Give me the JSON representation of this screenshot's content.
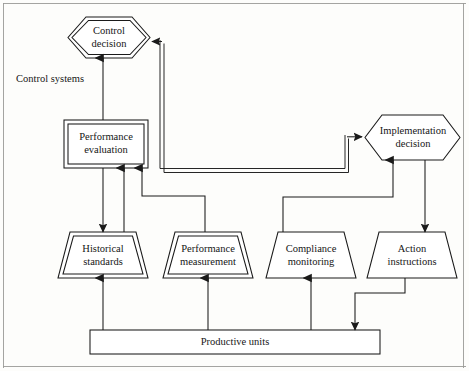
{
  "figure": {
    "background_color": "#fdfdfb",
    "line_color": "#1a1a1a",
    "text_color": "#161616"
  },
  "side_labels": [
    {
      "name": "control-systems",
      "line1": "Control",
      "line2": "systems"
    }
  ],
  "nodes": {
    "control_decision": {
      "shape": "hexagon-double",
      "line1": "Control",
      "line2": "decision"
    },
    "implementation_decision": {
      "shape": "hexagon-single",
      "line1": "Implementation",
      "line2": "decision"
    },
    "performance_evaluation": {
      "shape": "rectangle-double",
      "line1": "Performance",
      "line2": "evaluation"
    },
    "historical_standards": {
      "shape": "trapezoid-double",
      "line1": "Historical",
      "line2": "standards"
    },
    "performance_measurement": {
      "shape": "trapezoid-double",
      "line1": "Performance",
      "line2": "measurement"
    },
    "compliance_monitoring": {
      "shape": "trapezoid-single",
      "line1": "Compliance",
      "line2": "monitoring"
    },
    "action_instructions": {
      "shape": "trapezoid-single",
      "line1": "Action",
      "line2": "instructions"
    },
    "productive_units": {
      "shape": "bar",
      "line1": "Productive units"
    }
  },
  "connectors": [
    {
      "name": "performance-evaluation-to-control-decision",
      "style": "single",
      "arrow": "up"
    },
    {
      "name": "performance-evaluation-to-historical-standards",
      "style": "single",
      "arrow": "down"
    },
    {
      "name": "historical-standards-to-performance-evaluation",
      "style": "single",
      "arrow": "up"
    },
    {
      "name": "performance-measurement-to-performance-evaluation",
      "style": "single",
      "arrow": "up"
    },
    {
      "name": "feedback-to-control-decision",
      "style": "double",
      "arrow": "left"
    },
    {
      "name": "feedback-to-implementation-decision",
      "style": "double",
      "arrow": "right"
    },
    {
      "name": "compliance-monitoring-to-implementation-decision",
      "style": "single",
      "arrow": "up"
    },
    {
      "name": "implementation-decision-to-action-instructions",
      "style": "single",
      "arrow": "down"
    },
    {
      "name": "action-instructions-to-productive-units",
      "style": "single",
      "arrow": "down"
    },
    {
      "name": "productive-units-to-historical-standards",
      "style": "single",
      "arrow": "up"
    },
    {
      "name": "productive-units-to-performance-measurement",
      "style": "single",
      "arrow": "up"
    },
    {
      "name": "productive-units-to-compliance-monitoring",
      "style": "single",
      "arrow": "up"
    }
  ]
}
